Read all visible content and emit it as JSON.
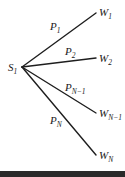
{
  "diagram": {
    "source": {
      "label": "S",
      "sub": "1"
    },
    "edges": [
      {
        "prob": "P",
        "prob_sub": "1",
        "target": "W",
        "target_sub": "1"
      },
      {
        "prob": "P",
        "prob_sub": "2",
        "target": "W",
        "target_sub": "2"
      },
      {
        "prob": "P",
        "prob_sub": "N−1",
        "target": "W",
        "target_sub": "N−1"
      },
      {
        "prob": "P",
        "prob_sub": "N",
        "target": "W",
        "target_sub": "N"
      }
    ],
    "colors": {
      "line": "#1e1e1e",
      "bar": "#2a2a2a"
    }
  }
}
